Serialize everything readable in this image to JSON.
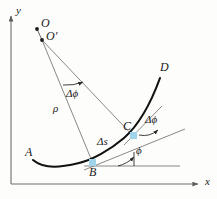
{
  "figure": {
    "type": "geometry-diagram",
    "background_color": "#fdfdfb",
    "curve_color": "#111111",
    "line_color": "#6b6b6b",
    "marker_color": "#9fd4ea",
    "text_color": "#1a1a1a"
  },
  "axes": {
    "x_label": "x",
    "y_label": "y",
    "x_axis": {
      "x1": 11,
      "y1": 184,
      "x2": 200,
      "y2": 184
    },
    "y_axis": {
      "x1": 11,
      "y1": 184,
      "x2": 11,
      "y2": 14
    }
  },
  "points": [
    {
      "name": "O",
      "label": "O",
      "x": 37,
      "y": 29,
      "label_x": 41,
      "label_y": 18,
      "marker": "dot"
    },
    {
      "name": "O'",
      "label": "O′",
      "x": 42,
      "y": 40,
      "label_x": 46,
      "label_y": 31,
      "marker": "dot"
    },
    {
      "name": "A",
      "label": "A",
      "x": 33,
      "y": 160,
      "label_x": 26,
      "label_y": 148,
      "marker": "none"
    },
    {
      "name": "B",
      "label": "B",
      "x": 93,
      "y": 163,
      "label_x": 90,
      "label_y": 167,
      "marker": "square"
    },
    {
      "name": "C",
      "label": "C",
      "x": 133,
      "y": 135,
      "label_x": 125,
      "label_y": 122,
      "marker": "square"
    },
    {
      "name": "D",
      "label": "D",
      "x": 160,
      "y": 78,
      "label_x": 161,
      "label_y": 63,
      "marker": "none"
    }
  ],
  "annotations": [
    {
      "name": "delta-phi-center",
      "label": "Δϕ",
      "x": 71,
      "y": 92
    },
    {
      "name": "rho",
      "label": "ρ",
      "x": 56,
      "y": 108
    },
    {
      "name": "delta-s",
      "label": "Δs",
      "x": 100,
      "y": 140
    },
    {
      "name": "delta-phi-tangent",
      "label": "Δϕ",
      "x": 148,
      "y": 118
    },
    {
      "name": "phi",
      "label": "ϕ",
      "x": 138,
      "y": 149
    }
  ],
  "segments": [
    {
      "name": "radius-to-B",
      "from": "O'",
      "to": "B"
    },
    {
      "name": "radius-to-C",
      "from": "O'",
      "to": "C"
    },
    {
      "name": "tangent-at-B"
    },
    {
      "name": "tangent-at-C"
    },
    {
      "name": "horizontal-at-B"
    }
  ]
}
